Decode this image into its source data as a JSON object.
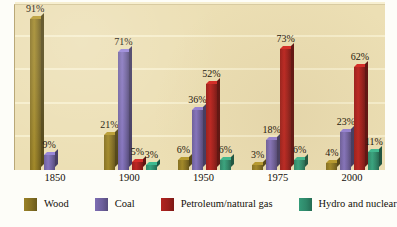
{
  "chart_data": {
    "type": "bar",
    "title": "",
    "subtitle": "",
    "xlabel": "",
    "ylabel": "",
    "ylim": [
      0,
      100
    ],
    "grid": true,
    "legend_position": "bottom",
    "categories": [
      "1850",
      "1900",
      "1950",
      "1975",
      "2000"
    ],
    "series": [
      {
        "name": "Wood",
        "color": "#857022",
        "values": [
          91,
          21,
          6,
          3,
          4
        ],
        "labels": [
          "91%",
          "21%",
          "6%",
          "3%",
          "4%"
        ]
      },
      {
        "name": "Coal",
        "color": "#6d5f9c",
        "values": [
          9,
          71,
          36,
          18,
          23
        ],
        "labels": [
          "9%",
          "71%",
          "36%",
          "18%",
          "23%"
        ]
      },
      {
        "name": "Petroleum/natural gas",
        "color": "#9b1f1c",
        "values": [
          0,
          5,
          52,
          73,
          62
        ],
        "labels": [
          "",
          "5%",
          "52%",
          "73%",
          "62%"
        ]
      },
      {
        "name": "Hydro and nuclear",
        "color": "#2e8769",
        "values": [
          0,
          3,
          6,
          6,
          11
        ],
        "labels": [
          "",
          "3%",
          "6%",
          "6%",
          "11%"
        ]
      }
    ],
    "gridline_values": [
      20,
      40,
      60,
      80,
      100
    ],
    "plot_background": "#ecdfb4",
    "gridline_color": "#f7eecd"
  },
  "legend": {
    "items": [
      {
        "label": "Wood",
        "color": "#857022"
      },
      {
        "label": "Coal",
        "color": "#6d5f9c"
      },
      {
        "label": "Petroleum/natural gas",
        "color": "#9b1f1c"
      },
      {
        "label": "Hydro and nuclear",
        "color": "#2e8769"
      }
    ]
  }
}
